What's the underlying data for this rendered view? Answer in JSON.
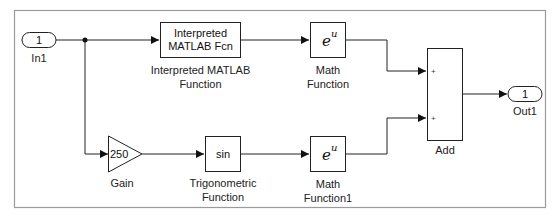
{
  "diagram": {
    "type": "simulink-model",
    "blocks": {
      "in1": {
        "port_number": "1",
        "label": "In1"
      },
      "interp_fcn": {
        "text_line1": "Interpreted",
        "text_line2": "MATLAB Fcn",
        "label_line1": "Interpreted MATLAB",
        "label_line2": "Function"
      },
      "math_fn": {
        "base": "e",
        "exponent": "u",
        "label_line1": "Math",
        "label_line2": "Function"
      },
      "gain": {
        "value": "250",
        "label": "Gain"
      },
      "trig": {
        "text": "sin",
        "label_line1": "Trigonometric",
        "label_line2": "Function"
      },
      "math_fn1": {
        "base": "e",
        "exponent": "u",
        "label_line1": "Math",
        "label_line2": "Function1"
      },
      "add": {
        "sign1": "+",
        "sign2": "+",
        "label": "Add"
      },
      "out1": {
        "port_number": "1",
        "label": "Out1"
      }
    },
    "connections": [
      {
        "from": "In1",
        "to": "Interpreted MATLAB Fcn"
      },
      {
        "from": "In1",
        "to": "Gain"
      },
      {
        "from": "Interpreted MATLAB Fcn",
        "to": "Math Function"
      },
      {
        "from": "Gain",
        "to": "Trigonometric Function"
      },
      {
        "from": "Trigonometric Function",
        "to": "Math Function1"
      },
      {
        "from": "Math Function",
        "to": "Add (input 1)"
      },
      {
        "from": "Math Function1",
        "to": "Add (input 2)"
      },
      {
        "from": "Add",
        "to": "Out1"
      }
    ]
  },
  "colors": {
    "border": "#9a9a9a",
    "line": "#222222",
    "block_fill": "#ffffff"
  }
}
